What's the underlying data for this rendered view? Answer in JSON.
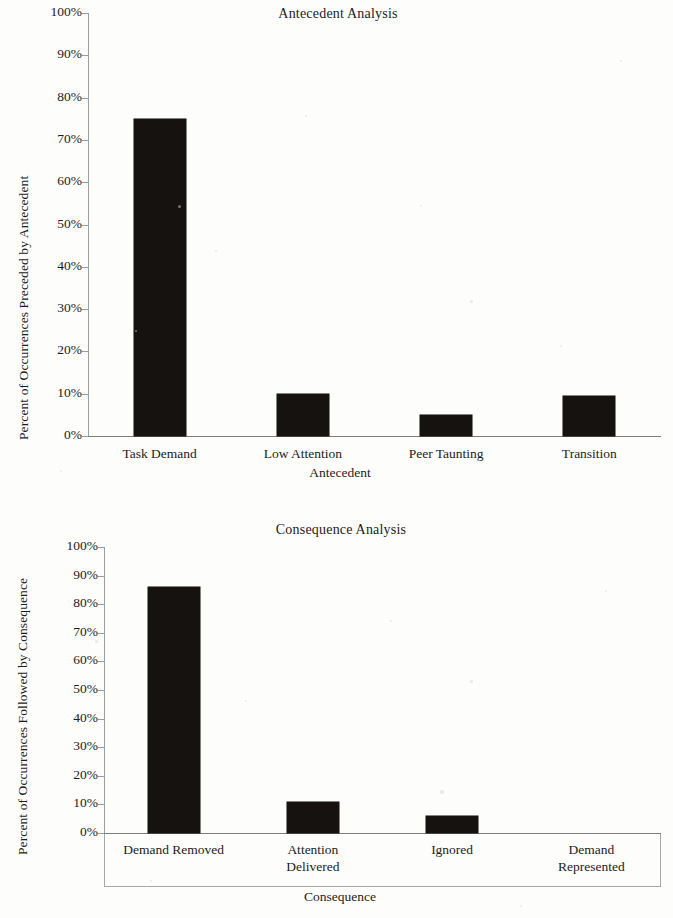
{
  "document": {
    "kind": "scanned-figure-page",
    "charts": 2
  },
  "chart_data": [
    {
      "type": "bar",
      "title": "Antecedent Analysis",
      "xlabel": "Antecedent",
      "ylabel": "Percent of Occurrences Preceded by Antecedent",
      "categories": [
        "Task Demand",
        "Low Attention",
        "Peer Taunting",
        "Transition"
      ],
      "values": [
        75,
        10,
        5,
        9.5
      ],
      "ylim": [
        0,
        100
      ],
      "ytick_labels": [
        "100%",
        "90%",
        "80%",
        "70%",
        "60%",
        "50%",
        "40%",
        "30%",
        "20%",
        "10%",
        "0%"
      ],
      "ytick_values": [
        100,
        90,
        80,
        70,
        60,
        50,
        40,
        30,
        20,
        10,
        0
      ],
      "grid": false,
      "legend": "none",
      "bar_color": "#15120f"
    },
    {
      "type": "bar",
      "title": "Consequence Analysis",
      "xlabel": "Consequence",
      "ylabel": "Percent of Occurrences Followed by Consequence",
      "categories": [
        "Demand Removed",
        "Attention Delivered",
        "Ignored",
        "Demand Represented"
      ],
      "category_lines": [
        [
          "Demand Removed"
        ],
        [
          "Attention",
          "Delivered"
        ],
        [
          "Ignored"
        ],
        [
          "Demand",
          "Represented"
        ]
      ],
      "values": [
        86,
        11,
        6,
        0
      ],
      "ylim": [
        0,
        100
      ],
      "ytick_labels": [
        "100%",
        "90%",
        "80%",
        "70%",
        "60%",
        "50%",
        "40%",
        "30%",
        "20%",
        "10%",
        "0%"
      ],
      "ytick_values": [
        100,
        90,
        80,
        70,
        60,
        50,
        40,
        30,
        20,
        10,
        0
      ],
      "grid": false,
      "legend": "none",
      "bar_color": "#15120f"
    }
  ]
}
